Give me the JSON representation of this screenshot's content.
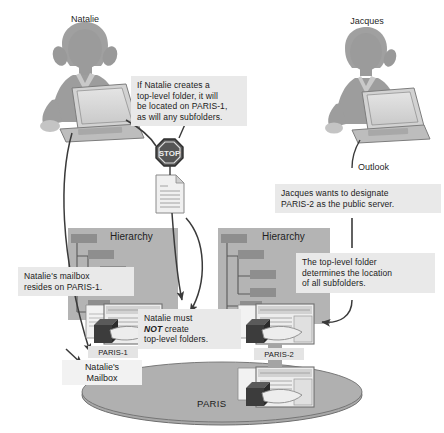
{
  "diagram": {
    "people": [
      {
        "id": "natalie",
        "name": "Natalie"
      },
      {
        "id": "jacques",
        "name": "Jacques"
      }
    ],
    "callouts": [
      {
        "id": "natalie-top-level",
        "text": "If Natalie creates a\ntop-level folder, it will\nbe located on PARIS-1,\nas will any subfolders."
      },
      {
        "id": "jacques-designate",
        "text": "Jacques wants to designate\nPARIS-2 as the public server."
      },
      {
        "id": "natalie-mailbox-resides",
        "text": "Natalie's mailbox\nresides on PARIS-1."
      },
      {
        "id": "natalie-must-not",
        "text_before": "Natalie must\n",
        "emphasis": "NOT",
        "text_after": " create\ntop-level folders."
      },
      {
        "id": "top-level-determines",
        "text": "The top-level folder\ndetermines the location\nof all subfolders."
      }
    ],
    "labels": {
      "outlook": "Outlook",
      "hierarchy_left": "Hierarchy",
      "hierarchy_right": "Hierarchy",
      "server_left": "PARIS-1",
      "server_right": "PARIS-2",
      "natalie_mailbox": "Natalie's\nMailbox",
      "site": "PARIS"
    },
    "icons": {
      "stop_sign": "STOP",
      "document": "document-icon",
      "server_left": "server-icon",
      "server_right": "server-icon",
      "server_site": "server-icon"
    },
    "colors": {
      "background": "#ffffff",
      "person": "#9d9d9d",
      "person_dark": "#8a8a8a",
      "panel": "#b4b4b4",
      "tree_node": "#8e8e8e",
      "callout_bg": "#e9e9e9",
      "label_bg": "#e4e4e4",
      "site_ellipse": "#a8a8a8",
      "line": "#3a3a3a",
      "stop_sign": "#4a4a4a",
      "text": "#1b1b1b"
    },
    "hierarchy_left": {
      "title": "Hierarchy",
      "nodes": [
        {
          "level": 0
        },
        {
          "level": 1
        },
        {
          "level": 2
        },
        {
          "level": 2
        },
        {
          "level": 1
        }
      ]
    },
    "hierarchy_right": {
      "title": "Hierarchy",
      "nodes": [
        {
          "level": 0
        },
        {
          "level": 1
        },
        {
          "level": 2
        },
        {
          "level": 2
        },
        {
          "level": 1
        },
        {
          "level": 1
        }
      ]
    }
  }
}
